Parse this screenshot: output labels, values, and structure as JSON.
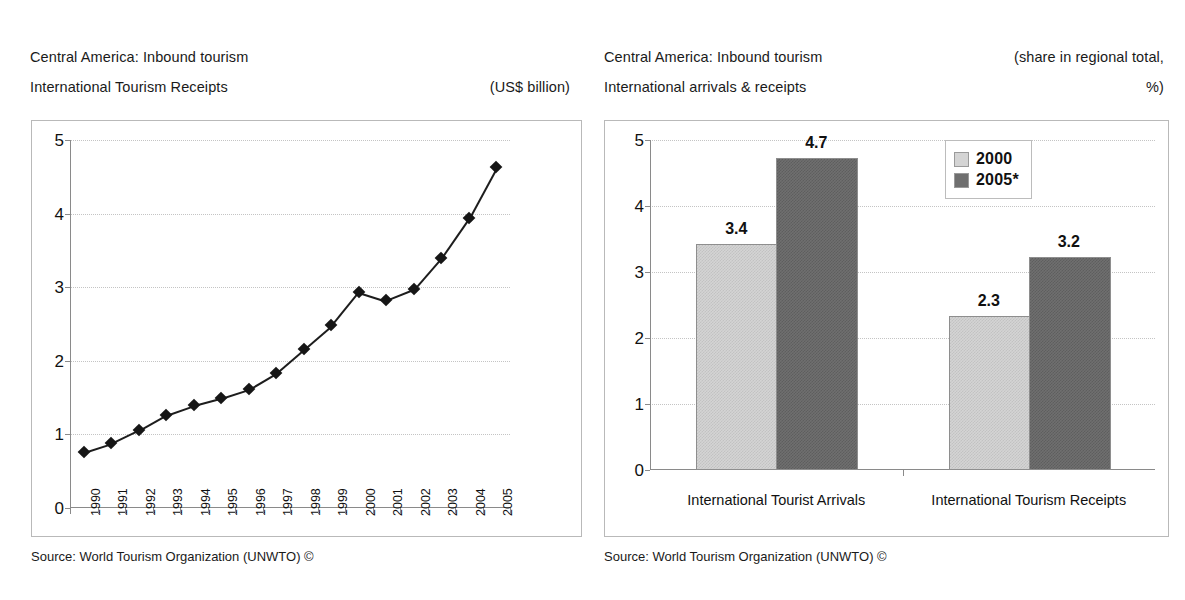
{
  "left_chart": {
    "title_line1": "Central America: Inbound tourism",
    "title_line2": "International Tourism Receipts",
    "unit_label": "(US$ billion)",
    "source": "Source: World Tourism Organization (UNWTO) ©"
  },
  "right_chart": {
    "title_line1": "Central America: Inbound tourism",
    "title_line2": "International arrivals & receipts",
    "unit_label_line1": "(share in regional total,",
    "unit_label_line2": "%)",
    "source": "Source: World Tourism Organization (UNWTO) ©"
  },
  "colors": {
    "series_2000": "#d4d4d4",
    "series_2005": "#6f6f6f",
    "line": "#1d1d1d",
    "grid": "#c4c4c4",
    "axis": "#8a8a8a"
  },
  "chart_data": [
    {
      "type": "line",
      "title": "Central America: Inbound tourism - International Tourism Receipts",
      "xlabel": "",
      "ylabel": "",
      "unit": "US$ billion",
      "grid": true,
      "legend": "none",
      "ylim": [
        0,
        5
      ],
      "yticks": [
        "0",
        "1",
        "2",
        "3",
        "4",
        "5"
      ],
      "categories": [
        "1990",
        "1991",
        "1992",
        "1993",
        "1994",
        "1995",
        "1996",
        "1997",
        "1998",
        "1999",
        "2000",
        "2001",
        "2002",
        "2003",
        "2004",
        "2005"
      ],
      "values": [
        0.76,
        0.88,
        1.06,
        1.27,
        1.4,
        1.5,
        1.62,
        1.84,
        2.16,
        2.48,
        2.94,
        2.82,
        2.97,
        3.4,
        3.94,
        4.63
      ],
      "source": "Source: World Tourism Organization (UNWTO) ©"
    },
    {
      "type": "bar",
      "title": "Central America: Inbound tourism - International arrivals & receipts",
      "xlabel": "",
      "ylabel": "",
      "unit": "share in regional total, %",
      "grid": true,
      "legend": "inside-top-right",
      "ylim": [
        0,
        5
      ],
      "yticks": [
        "0",
        "1",
        "2",
        "3",
        "4",
        "5"
      ],
      "categories": [
        "International Tourist Arrivals",
        "International Tourism Receipts"
      ],
      "series": [
        {
          "name": "2000",
          "values": [
            3.4,
            2.3
          ],
          "value_labels": [
            "3.4",
            "2.3"
          ]
        },
        {
          "name": "2005*",
          "values": [
            4.7,
            3.2
          ],
          "value_labels": [
            "4.7",
            "3.2"
          ]
        }
      ],
      "source": "Source: World Tourism Organization (UNWTO) ©"
    }
  ]
}
